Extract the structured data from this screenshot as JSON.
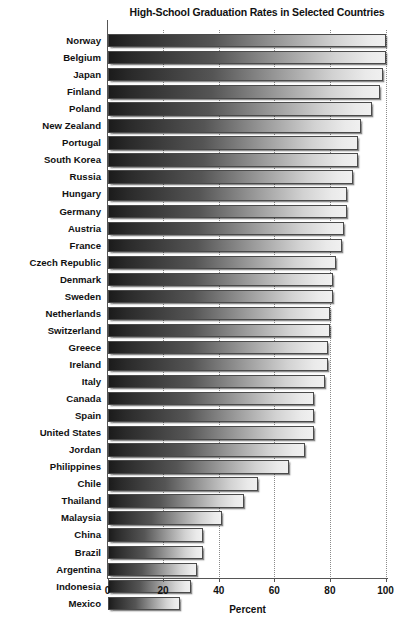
{
  "chart_data": {
    "type": "bar",
    "orientation": "horizontal",
    "title": "High-School Graduation Rates in Selected Countries",
    "xlabel": "Percent",
    "ylabel": "",
    "xlim": [
      0,
      100
    ],
    "xticks": [
      0,
      20,
      40,
      60,
      80,
      100
    ],
    "xtick_labels": [
      "0",
      "20",
      "40",
      "60",
      "80",
      "100"
    ],
    "grid": true,
    "grid_axis": "x",
    "grid_style": "dotted",
    "legend": false,
    "categories": [
      "Norway",
      "Belgium",
      "Japan",
      "Finland",
      "Poland",
      "New Zealand",
      "Portugal",
      "South Korea",
      "Russia",
      "Hungary",
      "Germany",
      "Austria",
      "France",
      "Czech Republic",
      "Denmark",
      "Sweden",
      "Netherlands",
      "Switzerland",
      "Greece",
      "Ireland",
      "Italy",
      "Canada",
      "Spain",
      "United States",
      "Jordan",
      "Philippines",
      "Chile",
      "Thailand",
      "Malaysia",
      "China",
      "Brazil",
      "Argentina",
      "Indonesia",
      "Mexico"
    ],
    "values": [
      100,
      100,
      99,
      98,
      95,
      91,
      90,
      90,
      88,
      86,
      86,
      85,
      84,
      82,
      81,
      81,
      80,
      80,
      79,
      79,
      78,
      74,
      74,
      74,
      71,
      65,
      54,
      49,
      41,
      34,
      34,
      32,
      30,
      26
    ],
    "bar_color_gradient": [
      "#1b1b1b",
      "#f0f0f0"
    ],
    "bar_border_color": "#4a4a4a"
  },
  "axis": {
    "x_title": "Percent"
  }
}
